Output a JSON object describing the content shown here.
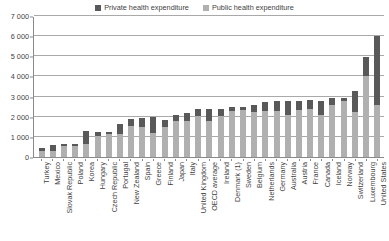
{
  "legend": {
    "position": "top-center",
    "entries": [
      {
        "label": "Private health expenditure",
        "color": "#595959",
        "key": "private"
      },
      {
        "label": "Public health expenditure",
        "color": "#b0b0b0",
        "key": "public"
      }
    ]
  },
  "axis": {
    "y_ticks": [
      "7 000",
      "6 000",
      "5 000",
      "4 000",
      "3 000",
      "2 000",
      "1 000",
      "0"
    ]
  },
  "chart_data": {
    "type": "bar",
    "subtype": "stacked-vertical",
    "title": "",
    "subtitle": "",
    "xlabel": "",
    "ylabel": "",
    "ylim": [
      0,
      7000
    ],
    "ytick_values": [
      0,
      1000,
      2000,
      3000,
      4000,
      5000,
      6000,
      7000
    ],
    "ytick_labels": [
      "0",
      "1 000",
      "2 000",
      "3 000",
      "4 000",
      "5 000",
      "6 000",
      "7 000"
    ],
    "grid": "horizontal",
    "legend_position": "top-center",
    "stack_order": [
      "public",
      "private"
    ],
    "categories": [
      "Turkey",
      "Mexico",
      "Slovak Republic",
      "Poland",
      "Korea",
      "Hungary",
      "Czech Republic",
      "Portugal",
      "New Zealand",
      "Spain",
      "Greece",
      "Finland",
      "Japan",
      "Italy",
      "United Kingdom",
      "OECD average",
      "Ireland",
      "Denmark (1)",
      "Sweden",
      "Belgium",
      "Netherlands",
      "Germany",
      "Australia",
      "Austria",
      "France",
      "Canada",
      "Iceland",
      "Norway",
      "Switzerland",
      "Luxembourg",
      "United States"
    ],
    "series": [
      {
        "name": "Public health expenditure",
        "color": "#b0b0b0",
        "values": [
          320,
          320,
          570,
          530,
          640,
          1020,
          1120,
          1150,
          1550,
          1490,
          1180,
          1480,
          1800,
          1800,
          2050,
          1800,
          2040,
          2270,
          2320,
          2230,
          2280,
          2280,
          2080,
          2310,
          2380,
          2070,
          2560,
          2770,
          2240,
          4010,
          2560
        ]
      },
      {
        "name": "Private health expenditure",
        "color": "#595959",
        "values": [
          130,
          260,
          70,
          130,
          630,
          200,
          130,
          470,
          330,
          450,
          810,
          380,
          290,
          390,
          350,
          590,
          360,
          200,
          180,
          340,
          450,
          480,
          690,
          470,
          440,
          700,
          380,
          170,
          1020,
          980,
          3440
        ]
      }
    ],
    "totals": [
      450,
      580,
      640,
      660,
      1270,
      1220,
      1250,
      1620,
      1880,
      1940,
      1990,
      1860,
      2090,
      2190,
      2400,
      2390,
      2400,
      2470,
      2500,
      2570,
      2730,
      2760,
      2770,
      2780,
      2820,
      2770,
      2940,
      2940,
      3260,
      4990,
      6000
    ]
  }
}
